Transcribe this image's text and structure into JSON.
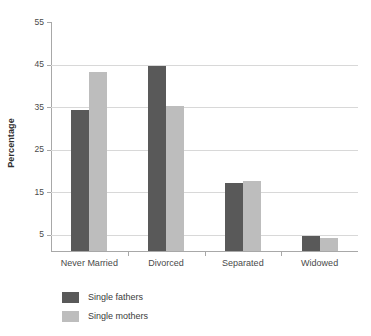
{
  "chart_data": {
    "type": "bar",
    "title": "",
    "xlabel": "",
    "ylabel": "Percentage",
    "categories": [
      "Never Married",
      "Divorced",
      "Separated",
      "Widowed"
    ],
    "series": [
      {
        "name": "Single fathers",
        "color": "#595959",
        "values": [
          34,
          44.5,
          17,
          4.5
        ]
      },
      {
        "name": "Single mothers",
        "color": "#bdbdbd",
        "values": [
          43,
          35,
          17.3,
          4
        ]
      }
    ],
    "ylim": [
      0.9,
      55
    ],
    "yticks": [
      55,
      45,
      35,
      25,
      15,
      5
    ],
    "ytick_labels": [
      "55",
      "45",
      "35",
      "25",
      "15",
      "5"
    ],
    "gridlines": [
      45,
      35,
      25,
      15,
      5
    ],
    "grid": true,
    "legend_position": "bottom-left"
  }
}
